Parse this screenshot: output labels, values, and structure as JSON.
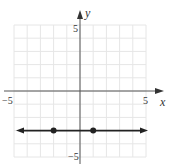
{
  "chart_data": {
    "type": "line",
    "title": "",
    "xlabel": "x",
    "ylabel": "y",
    "xlim": [
      -5,
      5
    ],
    "ylim": [
      -5,
      5
    ],
    "grid": true,
    "tick_labels": {
      "x_min": "−5",
      "x_max": "5",
      "y_min": "−5",
      "y_max": "5"
    },
    "series": [
      {
        "name": "horizontal line y = -3",
        "kind": "line with arrows both ends",
        "equation": "y = -3",
        "points": [
          {
            "x": -2,
            "y": -3
          },
          {
            "x": 1,
            "y": -3
          }
        ]
      }
    ]
  },
  "colors": {
    "grid": "#e6e6e6",
    "axis": "#555555",
    "line": "#222222"
  }
}
